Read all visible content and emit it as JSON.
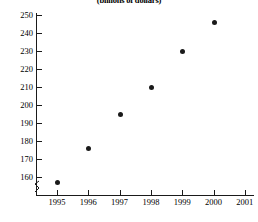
{
  "chart_data": {
    "type": "scatter",
    "title": "(billions of dollars)",
    "xlabel": "",
    "ylabel": "",
    "x": [
      1995,
      1996,
      1997,
      1998,
      1999,
      2000
    ],
    "values": [
      157,
      176,
      195,
      210,
      230,
      246
    ],
    "series": [
      {
        "name": "amount",
        "values": [
          157,
          176,
          195,
          210,
          230,
          246
        ]
      }
    ],
    "xlim": [
      1994.5,
      2001.5
    ],
    "ylim": [
      155,
      252
    ],
    "grid": false,
    "legend": false,
    "y_axis_break": true,
    "point_color": "#1a1a1a",
    "axis_color": "#1a1a1a",
    "y_ticks": [
      {
        "label": "250",
        "value": 250
      },
      {
        "label": "240",
        "value": 240
      },
      {
        "label": "230",
        "value": 230
      },
      {
        "label": "220",
        "value": 220
      },
      {
        "label": "210",
        "value": 210
      },
      {
        "label": "200",
        "value": 200
      },
      {
        "label": "190",
        "value": 190
      },
      {
        "label": "180",
        "value": 180
      },
      {
        "label": "170",
        "value": 170
      },
      {
        "label": "160",
        "value": 160
      }
    ],
    "x_ticks": [
      {
        "label": "1995",
        "value": 1995
      },
      {
        "label": "1996",
        "value": 1996
      },
      {
        "label": "1997",
        "value": 1997
      },
      {
        "label": "1998",
        "value": 1998
      },
      {
        "label": "1999",
        "value": 1999
      },
      {
        "label": "2000",
        "value": 2000
      },
      {
        "label": "2001",
        "value": 2001
      }
    ],
    "points": [
      {
        "x": 1995,
        "y": 157
      },
      {
        "x": 1996,
        "y": 176
      },
      {
        "x": 1997,
        "y": 195
      },
      {
        "x": 1998,
        "y": 210
      },
      {
        "x": 1999,
        "y": 230
      },
      {
        "x": 2000,
        "y": 246
      }
    ]
  }
}
